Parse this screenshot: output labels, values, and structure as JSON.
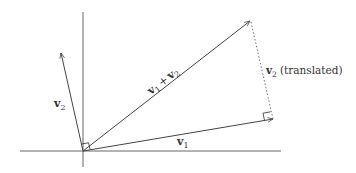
{
  "diagram": {
    "type": "vector-addition",
    "colors": {
      "axis": "#666666",
      "vector": "#444444",
      "dotted": "#777777",
      "text": "#333333",
      "background": "#ffffff"
    },
    "origin": {
      "x": 83,
      "y": 151
    },
    "axes": {
      "horizontal": {
        "x1": 20,
        "y1": 151,
        "x2": 281,
        "y2": 151
      },
      "vertical": {
        "x1": 83,
        "y1": 12,
        "x2": 83,
        "y2": 167
      }
    },
    "vectors": [
      {
        "id": "v1",
        "label_base": "v",
        "label_sub": "1",
        "tip": {
          "x": 273,
          "y": 119
        }
      },
      {
        "id": "v2",
        "label_base": "v",
        "label_sub": "2",
        "tip": {
          "x": 61,
          "y": 53
        }
      },
      {
        "id": "v1_plus_v2",
        "label": "v1 + v2",
        "tip": {
          "x": 250,
          "y": 21
        }
      }
    ],
    "translated_v2": {
      "from": {
        "x": 273,
        "y": 119
      },
      "to": {
        "x": 250,
        "y": 21
      },
      "style": "dotted"
    },
    "labels": {
      "v1": {
        "base": "v",
        "sub": "1"
      },
      "v2": {
        "base": "v",
        "sub": "2"
      },
      "sum": {
        "base1": "v",
        "sub1": "1",
        "op": "+",
        "base2": "v",
        "sub2": "2"
      },
      "translated": {
        "base": "v",
        "sub": "2",
        "suffix": "(translated)"
      }
    },
    "right_angle_markers": [
      {
        "at": "origin"
      },
      {
        "at": "v1-tip"
      }
    ]
  }
}
